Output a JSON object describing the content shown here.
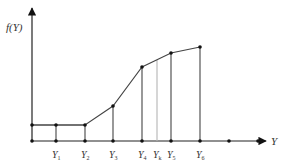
{
  "diagram": {
    "y_axis_label": "f(Y)",
    "x_axis_label": "Y",
    "origin": {
      "x": 32,
      "y": 141
    },
    "axis_end": {
      "x": 266,
      "y": 8
    },
    "base_level_y": 125,
    "curve_points": [
      {
        "x": 32,
        "y": 125
      },
      {
        "x": 56,
        "y": 125
      },
      {
        "x": 85,
        "y": 125
      },
      {
        "x": 113,
        "y": 106
      },
      {
        "x": 142,
        "y": 67
      },
      {
        "x": 171,
        "y": 53
      },
      {
        "x": 200,
        "y": 47
      }
    ],
    "ticks": [
      {
        "name": "Y",
        "sub": "1",
        "x": 56,
        "top": 125,
        "light": false
      },
      {
        "name": "Y",
        "sub": "2",
        "x": 85,
        "top": 125,
        "light": false
      },
      {
        "name": "Y",
        "sub": "3",
        "x": 113,
        "top": 106,
        "light": false
      },
      {
        "name": "Y",
        "sub": "4",
        "x": 142,
        "top": 67,
        "light": false
      },
      {
        "name": "Y",
        "sub": "k",
        "x": 157,
        "top": 60,
        "light": true
      },
      {
        "name": "Y",
        "sub": "5",
        "x": 171,
        "top": 53,
        "light": false
      },
      {
        "name": "Y",
        "sub": "6",
        "x": 200,
        "top": 47,
        "light": false
      }
    ],
    "extra_axis_points": [
      229,
      258
    ],
    "colors": {
      "line": "#444444",
      "light_line": "#b5b5b5",
      "point": "#111111"
    }
  }
}
